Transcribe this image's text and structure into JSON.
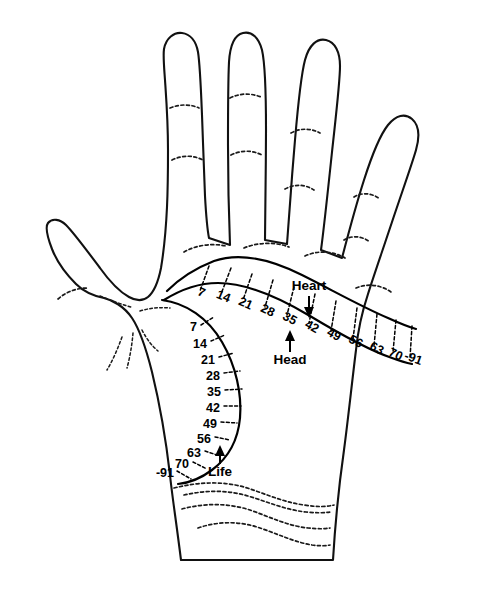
{
  "figure": {
    "background_color": "#ffffff",
    "ink_color": "#000000"
  },
  "lines": {
    "heart": {
      "label": "Heart",
      "arrow": "down-arrow-icon",
      "ages": [
        "7",
        "14",
        "21",
        "28",
        "35",
        "42",
        "49",
        "56",
        "63",
        "70",
        "-91"
      ]
    },
    "head": {
      "label": "Head",
      "arrow": "up-arrow-icon",
      "ages": [
        "7",
        "14",
        "21",
        "28",
        "35",
        "42",
        "49",
        "56",
        "63",
        "70",
        "-91"
      ]
    },
    "life": {
      "label": "Life",
      "arrow": "up-arrow-icon",
      "ages": [
        "7",
        "14",
        "21",
        "28",
        "35",
        "42",
        "49",
        "56",
        "63",
        "70",
        "-91"
      ]
    }
  },
  "life_marks": [
    {
      "age": "7",
      "tx": 190,
      "ty": 328,
      "x1": 201,
      "y1": 325,
      "x2": 213,
      "y2": 318
    },
    {
      "age": "14",
      "tx": 194,
      "ty": 345,
      "x1": 211,
      "y1": 341,
      "x2": 224,
      "y2": 335
    },
    {
      "age": "21",
      "tx": 201,
      "ty": 361,
      "x1": 219,
      "y1": 357,
      "x2": 233,
      "y2": 353
    },
    {
      "age": "28",
      "tx": 206,
      "ty": 377,
      "x1": 224,
      "y1": 373,
      "x2": 239,
      "y2": 371
    },
    {
      "age": "35",
      "tx": 207,
      "ty": 394,
      "x1": 225,
      "y1": 390,
      "x2": 241,
      "y2": 389
    },
    {
      "age": "42",
      "tx": 206,
      "ty": 410,
      "x1": 224,
      "y1": 406,
      "x2": 240,
      "y2": 406
    },
    {
      "age": "49",
      "tx": 204,
      "ty": 425,
      "x1": 221,
      "y1": 422,
      "x2": 236,
      "y2": 423
    },
    {
      "age": "56",
      "tx": 198,
      "ty": 440,
      "x1": 215,
      "y1": 437,
      "x2": 229,
      "y2": 440
    },
    {
      "age": "63",
      "tx": 189,
      "ty": 453,
      "x1": 205,
      "y1": 451,
      "x2": 219,
      "y2": 455
    },
    {
      "age": "70",
      "tx": 177,
      "ty": 463,
      "x1": 193,
      "y1": 462,
      "x2": 206,
      "y2": 468
    },
    {
      "age": "-91",
      "tx": 158,
      "ty": 471,
      "x1": 177,
      "y1": 471,
      "x2": 190,
      "y2": 478
    }
  ],
  "band_marks": [
    {
      "age": "7",
      "tx": 200,
      "ty": 295,
      "x1": 209,
      "y1": 268,
      "x2": 200,
      "y2": 290
    },
    {
      "age": "14",
      "tx": 220,
      "ty": 298,
      "x1": 231,
      "y1": 271,
      "x2": 221,
      "y2": 294
    },
    {
      "age": "21",
      "tx": 243,
      "ty": 305,
      "x1": 252,
      "y1": 276,
      "x2": 243,
      "y2": 300
    },
    {
      "age": "28",
      "tx": 264,
      "ty": 311,
      "x1": 273,
      "y1": 281,
      "x2": 265,
      "y2": 307
    },
    {
      "age": "35",
      "tx": 285,
      "ty": 318,
      "x1": 294,
      "y1": 287,
      "x2": 287,
      "y2": 315
    },
    {
      "age": "42",
      "tx": 305,
      "ty": 327,
      "x1": 315,
      "y1": 294,
      "x2": 309,
      "y2": 323
    },
    {
      "age": "49",
      "tx": 326,
      "ty": 334,
      "x1": 336,
      "y1": 301,
      "x2": 331,
      "y2": 331
    },
    {
      "age": "56",
      "tx": 347,
      "ty": 341,
      "x1": 357,
      "y1": 308,
      "x2": 353,
      "y2": 339
    },
    {
      "age": "63",
      "tx": 368,
      "ty": 347,
      "x1": 377,
      "y1": 314,
      "x2": 374,
      "y2": 346
    },
    {
      "age": "70",
      "tx": 387,
      "ty": 353,
      "x1": 396,
      "y1": 320,
      "x2": 393,
      "y2": 352
    },
    {
      "age": "-91",
      "tx": 405,
      "ty": 356,
      "x1": 412,
      "y1": 324,
      "x2": 410,
      "y2": 356
    }
  ],
  "annotations": {
    "heart_label": {
      "text": "Heart",
      "x": 309,
      "y": 290
    },
    "head_label": {
      "text": "Head",
      "x": 290,
      "y": 364
    },
    "life_label": {
      "text": "Life",
      "x": 220,
      "y": 473
    }
  }
}
